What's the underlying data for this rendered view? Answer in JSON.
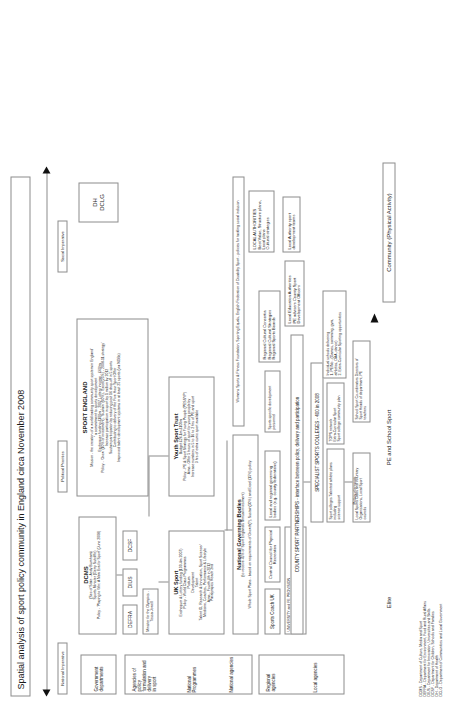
{
  "title": "Spatial analysis of sport policy community in England circa November 2008",
  "axes": {
    "left_label": "National Imperative",
    "mid_label": "Political Priorities",
    "right_label": "Social Imperative",
    "bottom_left": "Elite",
    "bottom_mid": "PE and School Sport",
    "bottom_right": "Community (Physical Activity)",
    "policy_elements": "Policy elements"
  },
  "row_labels": {
    "government_departments": "Government\ndepartments",
    "agencies": "Agencies of policy\nformulation and\ndelivery\nin sport",
    "national_programmes": "National\nProgrammes",
    "national_agencies": "National agencies",
    "regional_agencies": "Regional agencies",
    "local_agencies": "Local agencies"
  },
  "departments": {
    "dcms": {
      "title": "DCMS",
      "subtitle": "(Sec of State - Andy Burnham)",
      "line2": "Sports Minister (Gerry Sutcliffe)",
      "line3": "Policy - 'Playing to Win: A New Era for Sport' (June 2008)"
    },
    "defra": "DEFRA",
    "dius": "DIUS",
    "dcsf": "DCSF",
    "dh": "DH",
    "dclg": "DCLG",
    "olympics_minister": "Minister for the Olympics -\nTessa Jowell"
  },
  "sport_england": {
    "title": "SPORT ENGLAND",
    "lines": [
      "Mission - the creation of a world leading community sport system in England'",
      "\" a commitment to sports development",
      "Exchequer funding £100m - 2007   Lottery income - £60/m",
      "Policy - 'Grow' (10% of investment), 'Sustain' (60%), 'Excel'(25%) - 2008-11 strategy'",
      "Increase participation in sport by 1 million by 2012",
      "Sustain participation by reducing post 16 drop-off in 5 sports",
      "Contributing to delivery of the Five Hour Sport Offer",
      "Improved talent development systems in at least 25 sports (via NGBs)"
    ]
  },
  "uk_sport": {
    "title": "UK Sport",
    "lines": [
      "Exchequer & Lottery funding (100.4m 2007)",
      "Policy - World Class Programmes",
      "Podium",
      "Development",
      "Talent",
      "Talent ID, Research & Innovation, Sport Science/",
      "Medicine, Coaches, Performance & Lifestyle",
      "Aims - Fourth 4th in 2012",
      "Paralympics Reach 2nd"
    ]
  },
  "youth_sport_trust": {
    "title": "Youth Sport Trust",
    "lines": [
      "Budget £26.1m £100m",
      "Policy - PE & Sport Strategy for Young People (PESSYP)",
      "Aims - Offer 5 hours of sport for young people by",
      "Increase numbers in 5 to 16 to 2 hrs of PE and sport",
      "3 hrs of extra curric sport available"
    ]
  },
  "ngb": {
    "title": "National Governing Bodies",
    "lines": [
      "(to receive 45% of Sport England's annual investment)",
      "Whole Sport Plans - based on requirements of Growth(?), Sustain(30%) and Excel (15%) policy"
    ]
  },
  "national_bodies": {
    "sports_coach_uk": "Sports Coach UK",
    "ccpr": "Central Council for Physical\nRecreation",
    "womens_sport": "Womens Sports & Fitness Foundation, Sporting Equals, English Federation of Disability Sport - policies for tackling social inclusion",
    "university_fe": "UNIVERSITY and FE PROVISION\nHigher education Sport Regional networks, Sport\nscience support\nLocal academies of sport"
  },
  "regional": {
    "local_regional": "Local and regional governing\nbodies (e.g. county federations)",
    "sports_specific": "Sports specific development\npersonnel",
    "regional_cultural": "Regional Cultural Consortia\nRegional Cultural Strategies\nRegional Sports Boards"
  },
  "county_partnerships": {
    "title": "COUNTY SPORT PARTNERSHIPS - interface between policy, delivery and participation",
    "local_education": "Local Education Authorities\nPE advisers  County Sport\nDevelopment Officers"
  },
  "colleges": {
    "title": "SPECIALIST SPORTS COLLEGES - 400 in 2008",
    "left": "Sport colleges  Talented athlete plans including\nscience support",
    "mid": "TOPS network\nExtra-Curricular Sport\nSport college community plan",
    "right": "Individual schools delivering\n1. PE/No - (Games, swimming, gym,\nathletics, OAA, dance)\n2. Extra-Curricular Sporting opportunities"
  },
  "local": {
    "clubs": "Local Sports Clubs and Voluntary\nOrganisations, Local Sport\ncouncils",
    "school_coordinators": "School Sport Co-ordinators Directors of\nSport Heads of department, PE\nteachers",
    "local_authorities": "LOCAL AUTHORITIES\nBest Value, Structure plans,\nLocal plans\nCultural strategies",
    "la_sport_dev": "Local Authority sport\ndevelopment teams"
  },
  "key": [
    "DCMS - Department of Culture, Media and Sport",
    "DEFRA - Department for Environment, Food and Rural Affairs",
    "DIUS - Department for Innovation, Universities and Skills",
    "DCSF - Department for Children, Schools and Families",
    "DH - Department of Health",
    "DCLG - Department of Communities and Local Government"
  ]
}
